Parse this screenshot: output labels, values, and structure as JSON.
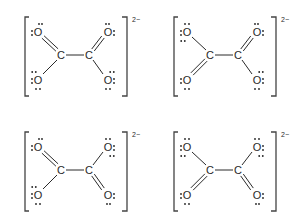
{
  "charge_label": "2−",
  "atom_labels": {
    "carbon": "C",
    "oxygen": "O"
  },
  "structures": [
    {
      "id": "top-left",
      "charge": "2−",
      "bonds": {
        "top_left": "double",
        "bottom_left": "single",
        "top_right": "double",
        "bottom_right": "single"
      }
    },
    {
      "id": "top-right",
      "charge": "2−",
      "bonds": {
        "top_left": "single",
        "bottom_left": "double",
        "top_right": "double",
        "bottom_right": "single"
      }
    },
    {
      "id": "bottom-left",
      "charge": "2−",
      "bonds": {
        "top_left": "double",
        "bottom_left": "single",
        "top_right": "single",
        "bottom_right": "double"
      }
    },
    {
      "id": "bottom-right",
      "charge": "2−",
      "bonds": {
        "top_left": "single",
        "bottom_left": "double",
        "top_right": "single",
        "bottom_right": "double"
      }
    }
  ]
}
